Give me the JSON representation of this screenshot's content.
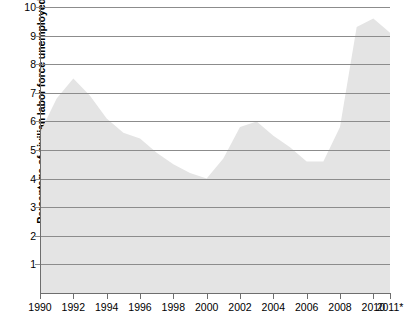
{
  "chart_data": {
    "type": "area",
    "title": "",
    "xlabel": "",
    "ylabel": "Percentage of civilian labor force unemployed",
    "ylim": [
      0,
      10
    ],
    "xlim": [
      1990,
      2011
    ],
    "grid": true,
    "legend": null,
    "fill_color": "#e4e4e4",
    "grid_color": "#8c8c8c",
    "axis_color": "#6e6e6e",
    "y_ticks": [
      "10",
      "9",
      "8",
      "7",
      "6",
      "5",
      "4",
      "3",
      "2",
      "1"
    ],
    "y_tick_values": [
      10,
      9,
      8,
      7,
      6,
      5,
      4,
      3,
      2,
      1
    ],
    "x_ticks": [
      "1990",
      "1992",
      "1994",
      "1996",
      "1998",
      "2000",
      "2002",
      "2004",
      "2006",
      "2008",
      "2010",
      "2011*"
    ],
    "x_tick_values": [
      1990,
      1992,
      1994,
      1996,
      1998,
      2000,
      2002,
      2004,
      2006,
      2008,
      2010,
      2011
    ],
    "x": [
      1990,
      1991,
      1992,
      1993,
      1994,
      1995,
      1996,
      1997,
      1998,
      1999,
      2000,
      2001,
      2002,
      2003,
      2004,
      2005,
      2006,
      2007,
      2008,
      2009,
      2010,
      2011
    ],
    "values": [
      5.6,
      6.8,
      7.5,
      6.9,
      6.1,
      5.6,
      5.4,
      4.9,
      4.5,
      4.2,
      4.0,
      4.7,
      5.8,
      6.0,
      5.5,
      5.1,
      4.6,
      4.6,
      5.8,
      9.3,
      9.6,
      9.1
    ],
    "series": [
      {
        "name": "Unemployment rate",
        "values": [
          5.6,
          6.8,
          7.5,
          6.9,
          6.1,
          5.6,
          5.4,
          4.9,
          4.5,
          4.2,
          4.0,
          4.7,
          5.8,
          6.0,
          5.5,
          5.1,
          4.6,
          4.6,
          5.8,
          9.3,
          9.6,
          9.1
        ]
      }
    ]
  }
}
